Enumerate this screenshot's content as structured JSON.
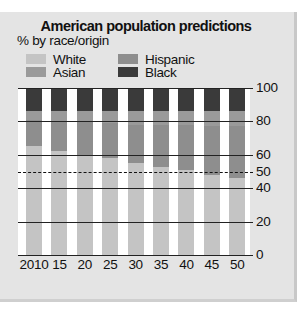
{
  "chart_data": {
    "type": "bar",
    "stacked": true,
    "title": "American population predictions",
    "subtitle": "% by race/origin",
    "xlabel": "",
    "ylabel": "",
    "ylim": [
      0,
      100
    ],
    "yticks": [
      0,
      20,
      40,
      50,
      60,
      80,
      100
    ],
    "reference_line": {
      "value": 50,
      "style": "dashed"
    },
    "grid": true,
    "y_axis_position": "right",
    "legend_position": "top",
    "categories": [
      "2010",
      "15",
      "20",
      "25",
      "30",
      "35",
      "40",
      "45",
      "50"
    ],
    "series": [
      {
        "name": "White",
        "color": "#c4c4c4",
        "values": [
          65,
          62,
          60,
          58,
          55,
          53,
          51,
          48,
          46
        ]
      },
      {
        "name": "Hispanic",
        "color": "#8e8e8e",
        "values": [
          16,
          18,
          20,
          21,
          23,
          25,
          27,
          29,
          31
        ]
      },
      {
        "name": "Asian",
        "color": "#9a9a9a",
        "values": [
          5,
          6,
          6,
          7,
          8,
          8,
          8,
          9,
          9
        ]
      },
      {
        "name": "Black",
        "color": "#3a3a3a",
        "values": [
          14,
          14,
          14,
          14,
          14,
          14,
          14,
          14,
          14
        ]
      }
    ]
  },
  "legend": [
    {
      "label": "White",
      "color": "#c4c4c4"
    },
    {
      "label": "Hispanic",
      "color": "#8e8e8e"
    },
    {
      "label": "Asian",
      "color": "#9a9a9a"
    },
    {
      "label": "Black",
      "color": "#3a3a3a"
    }
  ],
  "y_tick_labels": [
    "100",
    "80",
    "60",
    "50",
    "40",
    "20",
    "0"
  ]
}
